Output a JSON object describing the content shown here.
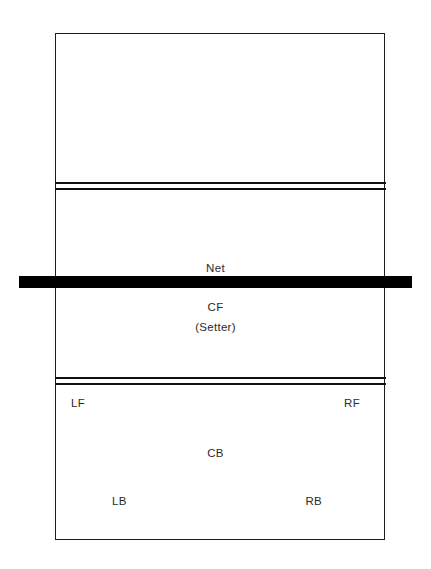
{
  "diagram": {
    "type": "volleyball-court",
    "background_color": "#ffffff",
    "line_color": "#111111",
    "net_color": "#000000"
  },
  "court": {
    "outline_label": "court-outline",
    "far_attack_line_label": "attack-line-far",
    "near_attack_line_label": "attack-line-near"
  },
  "net": {
    "label": "Net"
  },
  "positions": {
    "center_front": {
      "code": "CF",
      "role": "(Setter)"
    },
    "left_front": {
      "code": "LF"
    },
    "right_front": {
      "code": "RF"
    },
    "center_back": {
      "code": "CB"
    },
    "left_back": {
      "code": "LB"
    },
    "right_back": {
      "code": "RB"
    }
  }
}
